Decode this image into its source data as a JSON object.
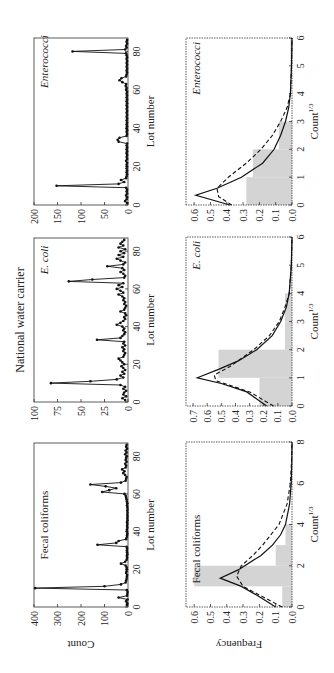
{
  "figure": {
    "title": "National water carrier",
    "colors": {
      "hist_fill": "#d4d4d4",
      "line": "#111111",
      "axis": "#333333"
    }
  },
  "chart_data": [
    {
      "type": "line",
      "panel": "top-left",
      "title": "Fecal coliforms",
      "xlabel": "Lot number",
      "ylabel": "Count",
      "xlim": [
        0,
        87
      ],
      "ylim": [
        0,
        400
      ],
      "xticks": [
        0,
        20,
        40,
        60,
        80
      ],
      "yticks": [
        0,
        100,
        200,
        300,
        400
      ],
      "points": [
        [
          1,
          5
        ],
        [
          2,
          3
        ],
        [
          3,
          8
        ],
        [
          4,
          2
        ],
        [
          5,
          40
        ],
        [
          6,
          4
        ],
        [
          7,
          3
        ],
        [
          8,
          2
        ],
        [
          9,
          5
        ],
        [
          10,
          395
        ],
        [
          11,
          100
        ],
        [
          12,
          30
        ],
        [
          13,
          10
        ],
        [
          14,
          8
        ],
        [
          15,
          6
        ],
        [
          16,
          5
        ],
        [
          17,
          4
        ],
        [
          18,
          8
        ],
        [
          19,
          6
        ],
        [
          20,
          5
        ],
        [
          21,
          6
        ],
        [
          22,
          10
        ],
        [
          23,
          30
        ],
        [
          24,
          12
        ],
        [
          25,
          6
        ],
        [
          26,
          4
        ],
        [
          27,
          5
        ],
        [
          28,
          3
        ],
        [
          29,
          4
        ],
        [
          30,
          5
        ],
        [
          31,
          4
        ],
        [
          32,
          6
        ],
        [
          33,
          130
        ],
        [
          34,
          50
        ],
        [
          35,
          40
        ],
        [
          36,
          8
        ],
        [
          37,
          5
        ],
        [
          38,
          4
        ],
        [
          39,
          3
        ],
        [
          40,
          4
        ],
        [
          41,
          5
        ],
        [
          42,
          3
        ],
        [
          43,
          4
        ],
        [
          44,
          3
        ],
        [
          45,
          4
        ],
        [
          46,
          2
        ],
        [
          47,
          3
        ],
        [
          48,
          2
        ],
        [
          49,
          3
        ],
        [
          50,
          2
        ],
        [
          51,
          3
        ],
        [
          52,
          2
        ],
        [
          53,
          3
        ],
        [
          54,
          4
        ],
        [
          55,
          3
        ],
        [
          56,
          5
        ],
        [
          57,
          6
        ],
        [
          58,
          8
        ],
        [
          59,
          10
        ],
        [
          60,
          15
        ],
        [
          61,
          110
        ],
        [
          62,
          80
        ],
        [
          63,
          50
        ],
        [
          64,
          95
        ],
        [
          65,
          160
        ],
        [
          66,
          30
        ],
        [
          67,
          10
        ],
        [
          68,
          8
        ],
        [
          69,
          6
        ],
        [
          70,
          12
        ],
        [
          71,
          20
        ],
        [
          72,
          15
        ],
        [
          73,
          25
        ],
        [
          74,
          10
        ],
        [
          75,
          8
        ],
        [
          76,
          12
        ],
        [
          77,
          6
        ],
        [
          78,
          10
        ],
        [
          79,
          8
        ],
        [
          80,
          5
        ],
        [
          81,
          12
        ],
        [
          82,
          6
        ],
        [
          83,
          10
        ],
        [
          84,
          4
        ],
        [
          85,
          8
        ],
        [
          86,
          6
        ]
      ]
    },
    {
      "type": "line",
      "panel": "top-middle",
      "title": "E. coli",
      "xlabel": "Lot number",
      "ylabel": "",
      "xlim": [
        0,
        87
      ],
      "ylim": [
        0,
        100
      ],
      "xticks": [
        0,
        20,
        40,
        60,
        80
      ],
      "yticks": [
        0,
        25,
        50,
        75,
        100
      ],
      "points": [
        [
          1,
          3
        ],
        [
          2,
          6
        ],
        [
          3,
          2
        ],
        [
          4,
          5
        ],
        [
          5,
          4
        ],
        [
          6,
          2
        ],
        [
          7,
          5
        ],
        [
          8,
          3
        ],
        [
          9,
          8
        ],
        [
          10,
          82
        ],
        [
          11,
          40
        ],
        [
          12,
          12
        ],
        [
          13,
          5
        ],
        [
          14,
          8
        ],
        [
          15,
          4
        ],
        [
          16,
          6
        ],
        [
          17,
          3
        ],
        [
          18,
          5
        ],
        [
          19,
          7
        ],
        [
          20,
          4
        ],
        [
          21,
          6
        ],
        [
          22,
          8
        ],
        [
          23,
          10
        ],
        [
          24,
          5
        ],
        [
          25,
          4
        ],
        [
          26,
          3
        ],
        [
          27,
          5
        ],
        [
          28,
          4
        ],
        [
          29,
          6
        ],
        [
          30,
          3
        ],
        [
          31,
          5
        ],
        [
          32,
          4
        ],
        [
          33,
          33
        ],
        [
          34,
          8
        ],
        [
          35,
          6
        ],
        [
          36,
          4
        ],
        [
          37,
          3
        ],
        [
          38,
          5
        ],
        [
          39,
          4
        ],
        [
          40,
          6
        ],
        [
          41,
          12
        ],
        [
          42,
          8
        ],
        [
          43,
          5
        ],
        [
          44,
          3
        ],
        [
          45,
          4
        ],
        [
          46,
          2
        ],
        [
          47,
          3
        ],
        [
          48,
          8
        ],
        [
          49,
          4
        ],
        [
          50,
          3
        ],
        [
          51,
          2
        ],
        [
          52,
          4
        ],
        [
          53,
          3
        ],
        [
          54,
          5
        ],
        [
          55,
          4
        ],
        [
          56,
          6
        ],
        [
          57,
          10
        ],
        [
          58,
          5
        ],
        [
          59,
          8
        ],
        [
          60,
          12
        ],
        [
          61,
          6
        ],
        [
          62,
          10
        ],
        [
          63,
          5
        ],
        [
          64,
          63
        ],
        [
          65,
          38
        ],
        [
          66,
          4
        ],
        [
          67,
          3
        ],
        [
          68,
          5
        ],
        [
          69,
          8
        ],
        [
          70,
          4
        ],
        [
          71,
          6
        ],
        [
          72,
          22
        ],
        [
          73,
          5
        ],
        [
          74,
          3
        ],
        [
          75,
          8
        ],
        [
          76,
          12
        ],
        [
          77,
          5
        ],
        [
          78,
          10
        ],
        [
          79,
          4
        ],
        [
          80,
          8
        ],
        [
          81,
          3
        ],
        [
          82,
          10
        ],
        [
          83,
          5
        ],
        [
          84,
          8
        ],
        [
          85,
          6
        ],
        [
          86,
          4
        ]
      ]
    },
    {
      "type": "line",
      "panel": "top-right",
      "title": "Enterococci",
      "xlabel": "Lot number",
      "ylabel": "",
      "xlim": [
        0,
        87
      ],
      "ylim": [
        0,
        200
      ],
      "xticks": [
        0,
        20,
        40,
        60,
        80
      ],
      "yticks": [
        0,
        50,
        100,
        150,
        200
      ],
      "points": [
        [
          1,
          2
        ],
        [
          2,
          6
        ],
        [
          3,
          3
        ],
        [
          4,
          2
        ],
        [
          5,
          4
        ],
        [
          6,
          2
        ],
        [
          7,
          3
        ],
        [
          8,
          2
        ],
        [
          9,
          4
        ],
        [
          10,
          152
        ],
        [
          11,
          20
        ],
        [
          12,
          8
        ],
        [
          13,
          15
        ],
        [
          14,
          4
        ],
        [
          15,
          3
        ],
        [
          16,
          2
        ],
        [
          17,
          3
        ],
        [
          18,
          2
        ],
        [
          19,
          3
        ],
        [
          20,
          2
        ],
        [
          21,
          3
        ],
        [
          22,
          2
        ],
        [
          23,
          4
        ],
        [
          24,
          2
        ],
        [
          25,
          3
        ],
        [
          26,
          2
        ],
        [
          27,
          3
        ],
        [
          28,
          2
        ],
        [
          29,
          3
        ],
        [
          30,
          2
        ],
        [
          31,
          3
        ],
        [
          32,
          2
        ],
        [
          33,
          20
        ],
        [
          34,
          22
        ],
        [
          35,
          18
        ],
        [
          36,
          3
        ],
        [
          37,
          2
        ],
        [
          38,
          3
        ],
        [
          39,
          2
        ],
        [
          40,
          3
        ],
        [
          41,
          2
        ],
        [
          42,
          3
        ],
        [
          43,
          2
        ],
        [
          44,
          3
        ],
        [
          45,
          2
        ],
        [
          46,
          3
        ],
        [
          47,
          2
        ],
        [
          48,
          3
        ],
        [
          49,
          2
        ],
        [
          50,
          3
        ],
        [
          51,
          2
        ],
        [
          52,
          3
        ],
        [
          53,
          2
        ],
        [
          54,
          3
        ],
        [
          55,
          2
        ],
        [
          56,
          3
        ],
        [
          57,
          2
        ],
        [
          58,
          3
        ],
        [
          59,
          2
        ],
        [
          60,
          4
        ],
        [
          61,
          3
        ],
        [
          62,
          5
        ],
        [
          63,
          4
        ],
        [
          64,
          12
        ],
        [
          65,
          18
        ],
        [
          66,
          14
        ],
        [
          67,
          4
        ],
        [
          68,
          3
        ],
        [
          69,
          2
        ],
        [
          70,
          3
        ],
        [
          71,
          2
        ],
        [
          72,
          3
        ],
        [
          73,
          2
        ],
        [
          74,
          3
        ],
        [
          75,
          2
        ],
        [
          76,
          3
        ],
        [
          77,
          2
        ],
        [
          78,
          3
        ],
        [
          79,
          4
        ],
        [
          80,
          118
        ],
        [
          81,
          6
        ],
        [
          82,
          3
        ],
        [
          83,
          4
        ],
        [
          84,
          2
        ],
        [
          85,
          3
        ],
        [
          86,
          2
        ]
      ]
    },
    {
      "type": "bar",
      "panel": "bottom-left",
      "title": "Fecal coliforms",
      "xlabel": "Count^1/3",
      "ylabel": "Frequency",
      "xlim": [
        0,
        8
      ],
      "ylim": [
        0,
        0.65
      ],
      "xticks": [
        0,
        2,
        4,
        6,
        8
      ],
      "yticks": [
        0.0,
        0.1,
        0.2,
        0.3,
        0.4,
        0.5,
        0.6
      ],
      "bins": [
        [
          0,
          1,
          0.06
        ],
        [
          1,
          2,
          0.6
        ],
        [
          2,
          3,
          0.1
        ],
        [
          3,
          4,
          0.04
        ]
      ],
      "fit_solid": [
        [
          0,
          0.1
        ],
        [
          0.5,
          0.2
        ],
        [
          1,
          0.31
        ],
        [
          1.4,
          0.44
        ],
        [
          1.8,
          0.33
        ],
        [
          2.5,
          0.19
        ],
        [
          3,
          0.12
        ],
        [
          3.5,
          0.07
        ],
        [
          4,
          0.04
        ],
        [
          5,
          0.015
        ],
        [
          6,
          0.005
        ],
        [
          7,
          0.001
        ],
        [
          8,
          0.0
        ]
      ],
      "fit_dashed": [
        [
          0,
          0.06
        ],
        [
          0.5,
          0.18
        ],
        [
          1,
          0.3
        ],
        [
          1.5,
          0.34
        ],
        [
          2,
          0.31
        ],
        [
          2.5,
          0.24
        ],
        [
          3,
          0.18
        ],
        [
          3.5,
          0.13
        ],
        [
          4,
          0.08
        ],
        [
          5,
          0.03
        ],
        [
          6,
          0.01
        ],
        [
          7,
          0.003
        ],
        [
          8,
          0.0
        ]
      ]
    },
    {
      "type": "bar",
      "panel": "bottom-middle",
      "title": "E. coli",
      "xlabel": "Count^1/3",
      "ylabel": "",
      "xlim": [
        0,
        6
      ],
      "ylim": [
        0,
        0.75
      ],
      "xticks": [
        0,
        1,
        2,
        3,
        4,
        5,
        6
      ],
      "yticks": [
        0.0,
        0.1,
        0.2,
        0.3,
        0.4,
        0.5,
        0.6,
        0.7
      ],
      "bins": [
        [
          0,
          1,
          0.23
        ],
        [
          1,
          2,
          0.52
        ],
        [
          2,
          3,
          0.05
        ],
        [
          3,
          4,
          0.05
        ],
        [
          4,
          5,
          0.01
        ]
      ],
      "fit_solid": [
        [
          0,
          0.18
        ],
        [
          0.5,
          0.32
        ],
        [
          0.8,
          0.5
        ],
        [
          1,
          0.67
        ],
        [
          1.3,
          0.52
        ],
        [
          1.6,
          0.38
        ],
        [
          2,
          0.25
        ],
        [
          2.5,
          0.14
        ],
        [
          3,
          0.08
        ],
        [
          3.5,
          0.04
        ],
        [
          4,
          0.02
        ],
        [
          5,
          0.005
        ],
        [
          6,
          0.0
        ]
      ],
      "fit_dashed": [
        [
          0,
          0.13
        ],
        [
          0.5,
          0.3
        ],
        [
          0.9,
          0.54
        ],
        [
          1.1,
          0.55
        ],
        [
          1.4,
          0.44
        ],
        [
          2,
          0.27
        ],
        [
          2.5,
          0.16
        ],
        [
          3,
          0.09
        ],
        [
          3.5,
          0.05
        ],
        [
          4,
          0.02
        ],
        [
          5,
          0.005
        ],
        [
          6,
          0.0
        ]
      ]
    },
    {
      "type": "bar",
      "panel": "bottom-right",
      "title": "Enterococci",
      "xlabel": "Count^1/3",
      "ylabel": "",
      "xlim": [
        0,
        6
      ],
      "ylim": [
        0,
        0.65
      ],
      "xticks": [
        0,
        1,
        2,
        3,
        4,
        5,
        6
      ],
      "yticks": [
        0.0,
        0.1,
        0.2,
        0.3,
        0.4,
        0.5,
        0.6
      ],
      "bins": [
        [
          0,
          1,
          0.28
        ],
        [
          1,
          2,
          0.24
        ],
        [
          2,
          3,
          0.08
        ],
        [
          5,
          6,
          0.01
        ]
      ],
      "fit_solid": [
        [
          0,
          0.38
        ],
        [
          0.35,
          0.59
        ],
        [
          0.6,
          0.46
        ],
        [
          1,
          0.31
        ],
        [
          1.5,
          0.18
        ],
        [
          2,
          0.11
        ],
        [
          2.5,
          0.07
        ],
        [
          3,
          0.04
        ],
        [
          3.5,
          0.02
        ],
        [
          4,
          0.01
        ],
        [
          5,
          0.003
        ],
        [
          6,
          0.0
        ]
      ],
      "fit_dashed": [
        [
          0,
          0.37
        ],
        [
          0.3,
          0.45
        ],
        [
          0.6,
          0.46
        ],
        [
          1,
          0.39
        ],
        [
          1.5,
          0.28
        ],
        [
          2,
          0.19
        ],
        [
          2.5,
          0.12
        ],
        [
          3,
          0.07
        ],
        [
          3.5,
          0.03
        ],
        [
          4,
          0.01
        ],
        [
          5,
          0.003
        ],
        [
          6,
          0.0
        ]
      ]
    }
  ]
}
